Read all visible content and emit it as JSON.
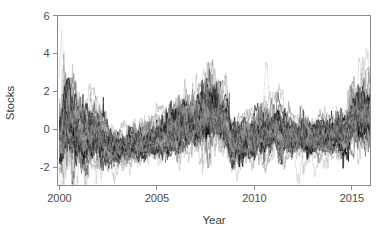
{
  "chart_data": {
    "type": "line",
    "title": "",
    "subtitle": "",
    "xlabel": "Year",
    "ylabel": "Stocks",
    "xlim": [
      1999.9,
      2015.95
    ],
    "ylim": [
      -2.95,
      6.0
    ],
    "xticks": [
      2000,
      2005,
      2010,
      2015
    ],
    "xtick_labels": [
      "2000",
      "2005",
      "2010",
      "2015"
    ],
    "yticks": [
      -2,
      0,
      2,
      4,
      6
    ],
    "ytick_labels": [
      "-2",
      "0",
      "2",
      "4",
      "6"
    ],
    "grid": false,
    "legend": false,
    "legend_position": "none",
    "n_series": 40,
    "series_description": "Overlaid standardized stock index time series (log-volatility style), monthly resolution 2000-2016, many thin gray-to-black traces",
    "line_colors": [
      "#000000",
      "#2a2a2a",
      "#4d4d4d",
      "#6e6e6e",
      "#8f8f8f",
      "#ababab",
      "#c2c2c2"
    ],
    "line_width": 0.45,
    "background": "#ffffff",
    "axis_color": "#8a8a8a",
    "text_color": "#4a4a4a",
    "annotations": [],
    "regime_keypoints": {
      "x": [
        2000.0,
        2000.3,
        2000.7,
        2001.2,
        2001.8,
        2002.3,
        2002.8,
        2003.3,
        2003.9,
        2004.6,
        2005.3,
        2005.9,
        2006.3,
        2006.8,
        2007.3,
        2007.7,
        2008.1,
        2008.5,
        2008.9,
        2009.3,
        2009.9,
        2010.5,
        2011.0,
        2011.6,
        2012.2,
        2012.8,
        2013.4,
        2014.0,
        2014.6,
        2015.1,
        2015.6,
        2015.9
      ],
      "mean": [
        -0.55,
        0.55,
        0.3,
        -0.35,
        -0.1,
        -0.55,
        -0.95,
        -1.0,
        -0.8,
        -0.55,
        -0.3,
        0.05,
        0.45,
        0.3,
        0.75,
        1.15,
        0.85,
        0.35,
        -0.75,
        -0.55,
        -0.3,
        -0.15,
        0.15,
        -0.25,
        -0.4,
        -0.45,
        -0.45,
        -0.4,
        -0.2,
        0.55,
        0.95,
        0.75
      ],
      "spread": [
        1.05,
        1.45,
        1.3,
        1.0,
        0.95,
        0.85,
        0.6,
        0.5,
        0.55,
        0.6,
        0.7,
        0.8,
        0.95,
        0.85,
        1.05,
        1.2,
        1.05,
        0.9,
        0.75,
        0.75,
        0.7,
        0.75,
        0.8,
        0.7,
        0.65,
        0.65,
        0.65,
        0.65,
        0.7,
        0.95,
        1.05,
        0.95
      ]
    },
    "observed_extremes": {
      "max_value": 4.15,
      "max_year": 2000.15,
      "min_value": -2.45,
      "min_year": 2002.6,
      "secondary_max_value": 3.6,
      "secondary_max_year": 2007.7,
      "late_max_value": 3.5,
      "late_max_year": 2015.4
    }
  },
  "axes": {
    "ylabel": "Stocks",
    "xlabel": "Year"
  }
}
